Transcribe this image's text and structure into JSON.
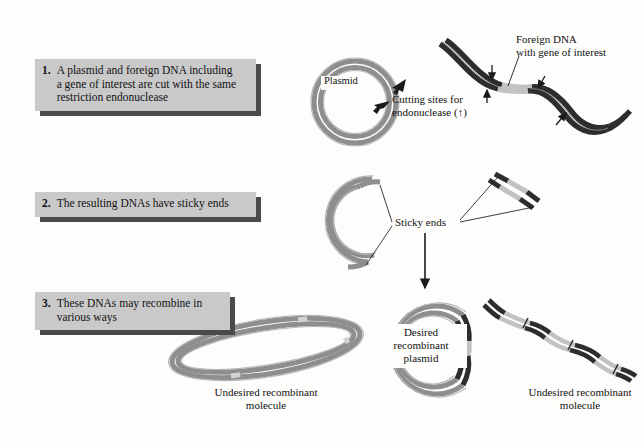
{
  "figure": {
    "background_color": "#fdfdfb",
    "box_fill": "#c9c9c9",
    "box_shadow": "#4a4a4a",
    "plasmid_gray": "#8e8e8e",
    "plasmid_light": "#b9b9b9",
    "foreign_dark": "#2d2d30",
    "gene_light": "#c2c2c2",
    "text_color": "#121214"
  },
  "steps": [
    {
      "number": "1.",
      "text": "A plasmid and foreign DNA including\na gene of interest are cut with the same\nrestriction endonuclease"
    },
    {
      "number": "2.",
      "text": "The resulting DNAs have sticky ends"
    },
    {
      "number": "3.",
      "text": "These DNAs may recombine in\nvarious ways"
    }
  ],
  "labels": {
    "plasmid": "Plasmid",
    "cutting_sites": "Cutting sites for\nendonuclease (↑)",
    "foreign_dna": "Foreign DNA\nwith gene of interest",
    "sticky_ends": "Sticky ends",
    "desired_plasmid": "Desired\nrecombinant\nplasmid",
    "undesired_left": "Undesired recombinant\nmolecule",
    "undesired_right": "Undesired recombinant\nmolecule"
  }
}
